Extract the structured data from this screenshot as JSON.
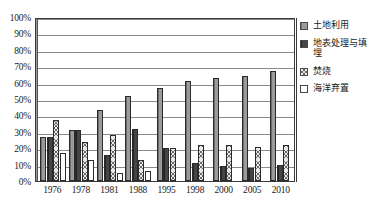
{
  "chart_data": {
    "type": "bar",
    "title": "",
    "xlabel": "",
    "ylabel": "",
    "ylim": [
      0,
      100
    ],
    "grid": true,
    "legend_position": "right",
    "categories": [
      "1976",
      "1978",
      "1981",
      "1988",
      "1995",
      "1998",
      "2000",
      "2005",
      "2010"
    ],
    "ytick_labels": [
      "0%",
      "10%",
      "20%",
      "30%",
      "40%",
      "50%",
      "60%",
      "70%",
      "80%",
      "90%",
      "100%"
    ],
    "ytick_values": [
      0,
      10,
      20,
      30,
      40,
      50,
      60,
      70,
      80,
      90,
      100
    ],
    "series": [
      {
        "name": "土地利用",
        "color": "#8e8e8e",
        "pattern": "solid-gray",
        "values": [
          27,
          31,
          43,
          52,
          57,
          61,
          63,
          64,
          67
        ]
      },
      {
        "name": "地表处理与填埋",
        "color": "#3b3b3b",
        "pattern": "solid-dark",
        "values": [
          27,
          31,
          16,
          32,
          20,
          11,
          9,
          8,
          10
        ]
      },
      {
        "name": "焚烧",
        "color": "#e9e9e9",
        "pattern": "cross-hatch",
        "values": [
          37,
          24,
          28,
          13,
          20,
          22,
          22,
          21,
          22
        ]
      },
      {
        "name": "海洋弃置",
        "color": "#ffffff",
        "pattern": "blank",
        "values": [
          17,
          13,
          5,
          6,
          0,
          0,
          0,
          0,
          0
        ]
      }
    ]
  },
  "legend": {
    "items": [
      {
        "label": "土地利用"
      },
      {
        "label": "地表处理与填埋"
      },
      {
        "label": "焚烧"
      },
      {
        "label": "海洋弃置"
      }
    ]
  },
  "caption": {
    "text": ""
  }
}
